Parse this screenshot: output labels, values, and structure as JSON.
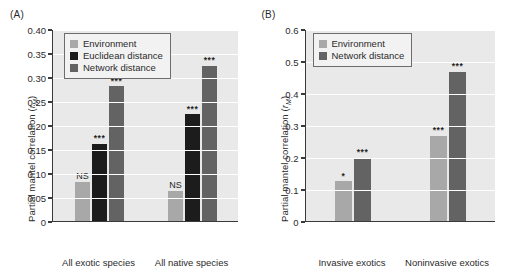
{
  "figure": {
    "panels": [
      {
        "id": "A",
        "label": "(A)",
        "ylabel_main": "Partial mantel correlation (",
        "ylabel_var": "r",
        "ylabel_sub": "M",
        "ylabel_close": ")"
      },
      {
        "id": "B",
        "label": "(B)",
        "ylabel_main": "Partial mantel correlation (",
        "ylabel_var": "r",
        "ylabel_sub": "M",
        "ylabel_close": ")"
      }
    ]
  },
  "colors": {
    "environment": "#a8a8a8",
    "euclidean_distance": "#1c1c1c",
    "network_distance": "#636363",
    "plot_background": "#e9e9e9",
    "gridline": "#ffffff",
    "axis": "#3a3a3a",
    "text": "#2b2b2b"
  },
  "chart_data": [
    {
      "type": "bar",
      "panel": "A",
      "title": "(A)",
      "xlabel": "",
      "ylabel": "Partial mantel correlation (rM)",
      "ylim": [
        0,
        0.4
      ],
      "yticks": [
        0,
        0.05,
        0.1,
        0.15,
        0.2,
        0.25,
        0.3,
        0.35,
        0.4
      ],
      "ytick_labels": [
        "0",
        "0.05",
        "0.10",
        "0.15",
        "0.20",
        "0.25",
        "0.30",
        "0.35",
        "0.40"
      ],
      "grid": true,
      "legend_position": "top-left",
      "categories": [
        "All exotic species",
        "All native species"
      ],
      "series": [
        {
          "name": "Environment",
          "color": "#a8a8a8",
          "values": [
            0.082,
            0.062
          ],
          "annotations": [
            "NS",
            "NS"
          ]
        },
        {
          "name": "Euclidean distance",
          "color": "#1c1c1c",
          "values": [
            0.161,
            0.222
          ],
          "annotations": [
            "***",
            "***"
          ]
        },
        {
          "name": "Network distance",
          "color": "#636363",
          "values": [
            0.281,
            0.323
          ],
          "annotations": [
            "***",
            "***"
          ]
        }
      ]
    },
    {
      "type": "bar",
      "panel": "B",
      "title": "(B)",
      "xlabel": "",
      "ylabel": "Partial mantel correlation (rM)",
      "ylim": [
        0,
        0.6
      ],
      "yticks": [
        0,
        0.1,
        0.2,
        0.3,
        0.4,
        0.5,
        0.6
      ],
      "ytick_labels": [
        "0",
        "0.1",
        "0.2",
        "0.3",
        "0.4",
        "0.5",
        "0.6"
      ],
      "grid": true,
      "legend_position": "top-left",
      "categories": [
        "Invasive exotics",
        "Noninvasive exotics"
      ],
      "series": [
        {
          "name": "Environment",
          "color": "#a8a8a8",
          "values": [
            0.125,
            0.267
          ],
          "annotations": [
            "*",
            "***"
          ]
        },
        {
          "name": "Network distance",
          "color": "#636363",
          "values": [
            0.197,
            0.467
          ],
          "annotations": [
            "***",
            "***"
          ]
        }
      ]
    }
  ]
}
